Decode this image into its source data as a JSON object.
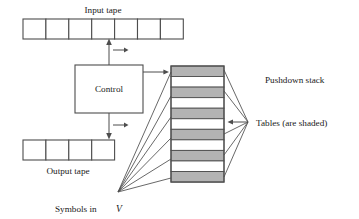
{
  "figure": {
    "type": "diagram",
    "labels": {
      "input_tape": "Input tape",
      "output_tape": "Output tape",
      "control": "Control",
      "pushdown_stack": "Pushdown stack",
      "tables": "Tables (are shaded)",
      "symbols_in": "Symbols in ",
      "symbols_in_var": "V"
    },
    "colors": {
      "shaded_band": "#b3b3b3",
      "line": "#4d4d4d",
      "background": "#ffffff",
      "text": "#1a1a1a"
    },
    "input_tape": {
      "cell_count": 7,
      "x": 23,
      "y": 19,
      "cell_width": 22.9,
      "height": 20,
      "head_arrow_label": "→"
    },
    "output_tape": {
      "cell_count": 4,
      "x": 23,
      "y": 140,
      "cell_width": 22.9,
      "height": 20,
      "head_arrow_label": "→"
    },
    "control_box": {
      "x": 75,
      "y": 65,
      "width": 68,
      "height": 48
    },
    "stack": {
      "x": 171,
      "y": 66,
      "width": 53,
      "band_height": 10.55,
      "band_count": 11,
      "shaded_pattern": [
        true,
        false,
        true,
        false,
        true,
        false,
        true,
        false,
        true,
        false,
        true
      ]
    },
    "fan_left_origin": {
      "x": 118,
      "y": 192
    },
    "fan_left_targets_y": [
      72,
      96,
      117,
      138,
      159,
      178
    ],
    "fan_right_origin": {
      "x": 248,
      "y": 122
    },
    "fan_right_targets_y": [
      70,
      91,
      113,
      134,
      155,
      177
    ],
    "pushdown_label_pos": {
      "x": 265,
      "y": 83
    },
    "tables_label_pos": {
      "x": 256,
      "y": 126
    },
    "symbols_label_pos": {
      "x": 55,
      "y": 212
    }
  }
}
